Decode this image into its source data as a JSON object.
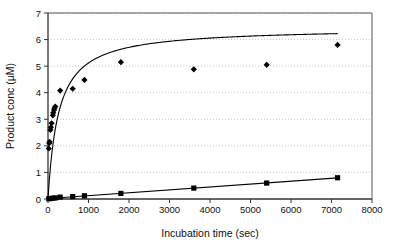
{
  "chart_data": {
    "type": "scatter",
    "title": "",
    "subtitle": "",
    "xlabel": "Incubation time (sec)",
    "ylabel": "Product conc (µM)",
    "xlim": [
      0,
      8000
    ],
    "ylim": [
      0,
      7
    ],
    "xticks": [
      0,
      1000,
      2000,
      3000,
      4000,
      5000,
      6000,
      7000,
      8000
    ],
    "yticks": [
      0,
      1,
      2,
      3,
      4,
      5,
      6,
      7
    ],
    "xtick_labels": [
      "0",
      "1000",
      "2000",
      "3000",
      "4000",
      "5000",
      "6000",
      "7000",
      "8000"
    ],
    "ytick_labels": [
      "0",
      "1",
      "2",
      "3",
      "4",
      "5",
      "6",
      "7"
    ],
    "grid": "horizontal-dotted",
    "legend": "none",
    "annotations": [],
    "series": [
      {
        "name": "fast-series",
        "marker": "diamond",
        "color": "#000000",
        "fit": "saturating-curve",
        "points": [
          {
            "x": 20,
            "y": 1.9
          },
          {
            "x": 30,
            "y": 2.1
          },
          {
            "x": 40,
            "y": 2.15
          },
          {
            "x": 60,
            "y": 2.6
          },
          {
            "x": 70,
            "y": 2.7
          },
          {
            "x": 90,
            "y": 2.85
          },
          {
            "x": 120,
            "y": 3.15
          },
          {
            "x": 130,
            "y": 3.25
          },
          {
            "x": 150,
            "y": 3.35
          },
          {
            "x": 160,
            "y": 3.42
          },
          {
            "x": 180,
            "y": 3.48
          },
          {
            "x": 300,
            "y": 4.08
          },
          {
            "x": 610,
            "y": 4.15
          },
          {
            "x": 900,
            "y": 4.48
          },
          {
            "x": 1800,
            "y": 5.15
          },
          {
            "x": 3600,
            "y": 4.88
          },
          {
            "x": 5400,
            "y": 5.05
          },
          {
            "x": 7150,
            "y": 5.8
          }
        ]
      },
      {
        "name": "slow-series",
        "marker": "square",
        "color": "#000000",
        "fit": "linear",
        "points": [
          {
            "x": 20,
            "y": 0.01
          },
          {
            "x": 60,
            "y": 0.02
          },
          {
            "x": 120,
            "y": 0.03
          },
          {
            "x": 180,
            "y": 0.04
          },
          {
            "x": 300,
            "y": 0.07
          },
          {
            "x": 610,
            "y": 0.09
          },
          {
            "x": 900,
            "y": 0.12
          },
          {
            "x": 1800,
            "y": 0.21
          },
          {
            "x": 3600,
            "y": 0.41
          },
          {
            "x": 5400,
            "y": 0.6
          },
          {
            "x": 7150,
            "y": 0.8
          }
        ]
      }
    ]
  }
}
